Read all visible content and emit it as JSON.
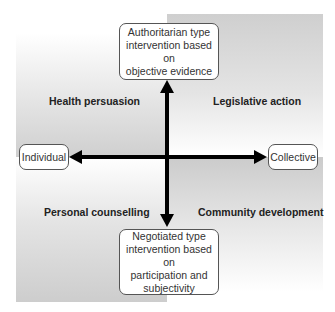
{
  "quadrants": {
    "top_left": "Health persuasion",
    "top_right": "Legislative action",
    "bottom_left": "Personal counselling",
    "bottom_right": "Community development"
  },
  "boxes": {
    "top": "Authoritarian type\nintervention based on\nobjective evidence",
    "bottom": "Negotiated type\nintervention based on\nparticipation and\nsubjectivity",
    "left": "Individual",
    "right": "Collective"
  },
  "colors": {
    "axis": "#000000",
    "box_border": "#555555",
    "quadrant_gray": "#cfcfcf"
  }
}
